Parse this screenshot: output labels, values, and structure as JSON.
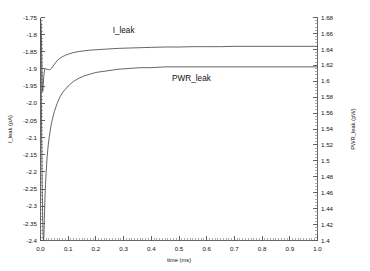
{
  "chart_data": {
    "type": "line",
    "title": "",
    "xlabel": "time (ms)",
    "ylabel": "I_leak (pA)",
    "y2label": "PWR_leak (pW)",
    "xlim": [
      0.0,
      1.0
    ],
    "ylim": [
      -2.4,
      -1.75
    ],
    "y2lim": [
      1.4,
      1.68
    ],
    "grid": false,
    "legend_position": "inline-annotation",
    "xticks": [
      "0.0",
      "0.1",
      "0.2",
      "0.3",
      "0.4",
      "0.5",
      "0.6",
      "0.7",
      "0.8",
      "0.9",
      "1.0"
    ],
    "xtick_values": [
      0.0,
      0.1,
      0.2,
      0.3,
      0.4,
      0.5,
      0.6,
      0.7,
      0.8,
      0.9,
      1.0
    ],
    "xminor_step": 0.01,
    "yticks": [
      "-1.75",
      "-1.8",
      "-1.85",
      "-1.9",
      "-1.95",
      "-2.0",
      "-2.05",
      "-2.1",
      "-2.15",
      "-2.2",
      "-2.25",
      "-2.3",
      "-2.35",
      "-2.4"
    ],
    "ytick_values": [
      -1.75,
      -1.8,
      -1.85,
      -1.9,
      -1.95,
      -2.0,
      -2.05,
      -2.1,
      -2.15,
      -2.2,
      -2.25,
      -2.3,
      -2.35,
      -2.4
    ],
    "yminor_step": 0.01,
    "y2ticks": [
      "1.68",
      "1.66",
      "1.64",
      "1.62",
      "1.6",
      "1.58",
      "1.56",
      "1.54",
      "1.52",
      "1.5",
      "1.48",
      "1.46",
      "1.44",
      "1.42",
      "1.4"
    ],
    "y2tick_values": [
      1.68,
      1.66,
      1.64,
      1.62,
      1.6,
      1.58,
      1.56,
      1.54,
      1.52,
      1.5,
      1.48,
      1.46,
      1.44,
      1.42,
      1.4
    ],
    "y2minor_step": 0.004,
    "series": [
      {
        "name": "I_leak",
        "axis": "left",
        "units": "pA",
        "color": "#4a4a4a",
        "annotation": "I_leak",
        "x": [
          0.0,
          0.002,
          0.004,
          0.005,
          0.006,
          0.007,
          0.008,
          0.009,
          0.01,
          0.012,
          0.014,
          0.016,
          0.018,
          0.02,
          0.024,
          0.028,
          0.032,
          0.036,
          0.04,
          0.045,
          0.05,
          0.06,
          0.07,
          0.08,
          0.09,
          0.1,
          0.12,
          0.14,
          0.16,
          0.18,
          0.2,
          0.24,
          0.28,
          0.32,
          0.36,
          0.4,
          0.45,
          0.5,
          0.55,
          0.6,
          0.65,
          0.7,
          0.75,
          0.8,
          0.85,
          0.9,
          0.95,
          1.0
        ],
        "y": [
          -1.752,
          -1.77,
          -1.83,
          -1.88,
          -1.93,
          -1.958,
          -1.966,
          -1.96,
          -1.946,
          -1.92,
          -1.906,
          -1.9,
          -1.899,
          -1.9,
          -1.901,
          -1.902,
          -1.902,
          -1.901,
          -1.898,
          -1.892,
          -1.886,
          -1.876,
          -1.869,
          -1.864,
          -1.86,
          -1.857,
          -1.852,
          -1.849,
          -1.847,
          -1.845,
          -1.844,
          -1.842,
          -1.84,
          -1.839,
          -1.838,
          -1.837,
          -1.836,
          -1.836,
          -1.835,
          -1.835,
          -1.835,
          -1.834,
          -1.834,
          -1.834,
          -1.834,
          -1.834,
          -1.834,
          -1.834
        ]
      },
      {
        "name": "PWR_leak",
        "axis": "right",
        "units": "pW",
        "color": "#4a4a4a",
        "annotation": "PWR_leak",
        "x": [
          0.0,
          0.002,
          0.004,
          0.006,
          0.008,
          0.01,
          0.011,
          0.012,
          0.013,
          0.014,
          0.016,
          0.018,
          0.02,
          0.024,
          0.028,
          0.032,
          0.036,
          0.04,
          0.05,
          0.06,
          0.07,
          0.08,
          0.09,
          0.1,
          0.12,
          0.14,
          0.16,
          0.18,
          0.2,
          0.24,
          0.28,
          0.32,
          0.36,
          0.4,
          0.45,
          0.5,
          0.55,
          0.6,
          0.65,
          0.7,
          0.75,
          0.8,
          0.85,
          0.9,
          0.95,
          1.0
        ],
        "y": [
          1.678,
          1.62,
          1.54,
          1.47,
          1.424,
          1.402,
          1.4,
          1.404,
          1.414,
          1.428,
          1.452,
          1.47,
          1.484,
          1.505,
          1.52,
          1.531,
          1.54,
          1.548,
          1.562,
          1.572,
          1.58,
          1.586,
          1.59,
          1.594,
          1.6,
          1.604,
          1.607,
          1.609,
          1.611,
          1.613,
          1.615,
          1.616,
          1.617,
          1.617,
          1.618,
          1.618,
          1.618,
          1.618,
          1.618,
          1.618,
          1.618,
          1.618,
          1.618,
          1.618,
          1.618,
          1.618
        ]
      }
    ],
    "annotations": [
      {
        "text": "I_leak",
        "x": 0.3,
        "y_axis": "left",
        "y": -1.795
      },
      {
        "text": "PWR_leak",
        "x": 0.545,
        "y_axis": "right",
        "y": 1.6
      }
    ]
  }
}
